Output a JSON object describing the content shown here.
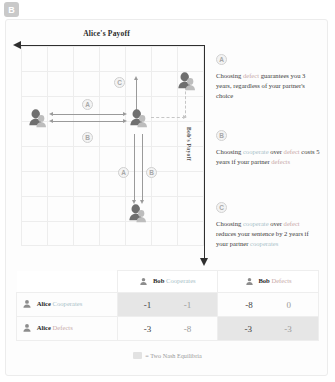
{
  "panel": {
    "badge": "B"
  },
  "chart_data": {
    "type": "scatter",
    "title": "Alice's Payoff",
    "xlabel": "Alice's Payoff",
    "ylabel": "Bob's Payoff",
    "grid": true,
    "legend_position": "none",
    "points": [
      {
        "name": "cooperate-cooperate",
        "label": "Alice Cooperates / Bob Cooperates",
        "x": -1,
        "y": -1
      },
      {
        "name": "defect-cooperate",
        "label": "Alice Defects / Bob Cooperates",
        "x": -8,
        "y": 0
      },
      {
        "name": "cooperate-defect",
        "label": "Alice Cooperates / Bob Defects",
        "x": -3,
        "y": -8
      },
      {
        "name": "defect-defect",
        "label": "Alice Defects / Bob Defects",
        "x": -3,
        "y": -3
      }
    ],
    "annotations": [
      {
        "id": "A",
        "orientation": "horizontal",
        "note": "defect guarantees 3 years"
      },
      {
        "id": "B",
        "orientation": "horizontal",
        "note": "cooperate costs 5 years if partner defects"
      },
      {
        "id": "C",
        "orientation": "vertical",
        "note": "cooperate reduces sentence by 2 years"
      },
      {
        "id": "A",
        "orientation": "vertical",
        "note": "defect guarantees 3 years"
      },
      {
        "id": "B",
        "orientation": "vertical",
        "note": "cooperate costs 5 years if partner defects"
      }
    ]
  },
  "notes": [
    {
      "badge": "A",
      "segments": [
        {
          "t": "Choosing ",
          "k": ""
        },
        {
          "t": "defect",
          "k": "defect"
        },
        {
          "t": " guarantees you 3 years, regardless of your partner's choice",
          "k": ""
        }
      ]
    },
    {
      "badge": "B",
      "segments": [
        {
          "t": "Choosing ",
          "k": ""
        },
        {
          "t": "cooperate",
          "k": "coop"
        },
        {
          "t": " over ",
          "k": ""
        },
        {
          "t": "defect",
          "k": "defect"
        },
        {
          "t": " costs 5 years if your partner ",
          "k": ""
        },
        {
          "t": "defects",
          "k": "defect"
        }
      ]
    },
    {
      "badge": "C",
      "segments": [
        {
          "t": "Choosing ",
          "k": ""
        },
        {
          "t": "cooperate",
          "k": "coop"
        },
        {
          "t": " over ",
          "k": ""
        },
        {
          "t": "defect",
          "k": "defect"
        },
        {
          "t": " reduces your sentence by 2 years if your partner ",
          "k": ""
        },
        {
          "t": "cooperates",
          "k": "coop"
        }
      ]
    }
  ],
  "matrix": {
    "col_headers": [
      {
        "name": "Bob",
        "action": "Cooperates"
      },
      {
        "name": "Bob",
        "action": "Defects"
      }
    ],
    "row_headers": [
      {
        "name": "Alice",
        "action": "Cooperates"
      },
      {
        "name": "Alice",
        "action": "Defects"
      }
    ],
    "cells": [
      [
        {
          "alice": "-1",
          "bob": "-1",
          "nash": true
        },
        {
          "alice": "-8",
          "bob": "0",
          "nash": false
        }
      ],
      [
        {
          "alice": "-3",
          "bob": "-8",
          "nash": false
        },
        {
          "alice": "-3",
          "bob": "-3",
          "nash": true
        }
      ]
    ],
    "legend": "= Two Nash Equilibria"
  }
}
